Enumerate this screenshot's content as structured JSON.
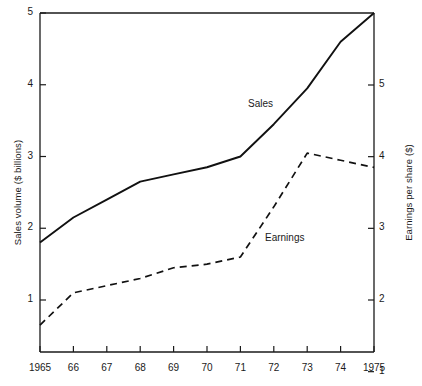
{
  "chart_data": {
    "type": "line",
    "title": "",
    "xlabel": "",
    "categories": [
      "1965",
      "66",
      "67",
      "68",
      "69",
      "70",
      "71",
      "72",
      "73",
      "74",
      "1975"
    ],
    "x": [
      1965,
      1966,
      1967,
      1968,
      1969,
      1970,
      1971,
      1972,
      1973,
      1974,
      1975
    ],
    "grid": false,
    "legend_position": "inline-annotation",
    "axes": {
      "left": {
        "label": "Sales volume ($ billions)",
        "ticks": [
          1,
          2,
          3,
          4,
          5
        ],
        "tick_labels": [
          "1",
          "2",
          "3",
          "4",
          "5"
        ],
        "ylim": [
          0.6,
          5.0
        ]
      },
      "right": {
        "label": "Earnings per share ($)",
        "ticks": [
          1,
          2,
          3,
          4,
          5
        ],
        "tick_labels": [
          "1",
          "2",
          "3",
          "4",
          "5"
        ],
        "ylim": [
          1.0,
          5.7
        ]
      }
    },
    "series": [
      {
        "name": "Sales",
        "axis": "left",
        "style": "solid",
        "color": "#111111",
        "values": [
          1.8,
          2.15,
          2.4,
          2.65,
          2.75,
          2.85,
          3.0,
          3.45,
          3.95,
          4.6,
          5.0
        ]
      },
      {
        "name": "Earnings",
        "axis": "right",
        "style": "dashed",
        "color": "#111111",
        "values": [
          1.65,
          2.1,
          2.2,
          2.3,
          2.45,
          2.5,
          2.6,
          3.3,
          4.05,
          3.95,
          3.85
        ]
      }
    ],
    "annotations": [
      {
        "text": "Sales",
        "x_px": 248,
        "y_px": 98
      },
      {
        "text": "Earnings",
        "x_px": 265,
        "y_px": 232
      }
    ]
  }
}
